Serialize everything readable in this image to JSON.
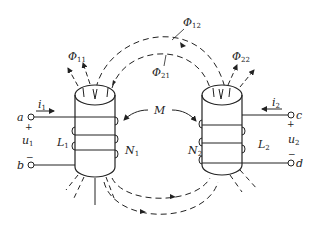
{
  "diagram": {
    "flux_labels": {
      "phi11": {
        "symbol": "Φ",
        "sub": "11"
      },
      "phi12": {
        "symbol": "Φ",
        "sub": "12"
      },
      "phi21": {
        "symbol": "Φ",
        "sub": "21"
      },
      "phi22": {
        "symbol": "Φ",
        "sub": "22"
      }
    },
    "mutual": {
      "symbol": "M"
    },
    "coil1": {
      "current": {
        "symbol": "i",
        "sub": "1"
      },
      "voltage": {
        "symbol": "u",
        "sub": "1"
      },
      "inductance": {
        "symbol": "L",
        "sub": "1"
      },
      "turns": {
        "symbol": "N",
        "sub": "1"
      },
      "terminal_top": "a",
      "terminal_bottom": "b",
      "plus": "+",
      "minus": "−"
    },
    "coil2": {
      "current": {
        "symbol": "i",
        "sub": "2"
      },
      "voltage": {
        "symbol": "u",
        "sub": "2"
      },
      "inductance": {
        "symbol": "L",
        "sub": "2"
      },
      "turns": {
        "symbol": "N",
        "sub": "2"
      },
      "terminal_top": "c",
      "terminal_bottom": "d",
      "plus": "+",
      "minus": "−"
    },
    "colors": {
      "line": "#222222",
      "background": "#ffffff"
    }
  }
}
